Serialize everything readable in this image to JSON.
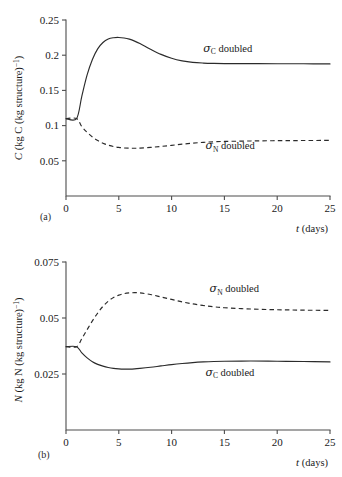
{
  "figure": {
    "cropped_top_caption": "",
    "panel_a_tag": "(a)",
    "panel_b_tag": "(b)"
  },
  "labels": {
    "t_italic": "t",
    "days": "(days)",
    "C_italic": "C",
    "N_italic": "N",
    "y_a_unit_1": "(kg C (kg structure)",
    "y_a_unit_sup": "−1",
    "y_a_unit_2": ")",
    "y_b_unit_1": "(kg N (kg structure)",
    "y_b_unit_sup": "−1",
    "y_b_unit_2": ")",
    "sigma": "σ",
    "sub_C": "C",
    "sub_N": "N",
    "doubled": "doubled"
  },
  "chart_data": [
    {
      "type": "line",
      "panel": "(a)",
      "title": "",
      "xlabel": "t (days)",
      "ylabel": "C (kg C (kg structure)−1)",
      "xlim": [
        0,
        25
      ],
      "ylim": [
        0,
        0.25
      ],
      "xticks": [
        0,
        5,
        10,
        15,
        20,
        25
      ],
      "xtick_labels": [
        "0",
        "5",
        "10",
        "15",
        "20",
        "25"
      ],
      "yticks": [
        0.05,
        0.1,
        0.15,
        0.2,
        0.25
      ],
      "ytick_labels": [
        "0.05",
        "0.1",
        "0.15",
        "0.2",
        "0.25"
      ],
      "grid": false,
      "legend": "inline-annotations",
      "x": [
        0,
        1,
        1.5,
        2,
        2.5,
        3,
        3.5,
        4,
        4.5,
        5,
        5.5,
        6,
        6.5,
        7,
        8,
        9,
        10,
        11,
        12,
        13,
        14,
        15,
        17.5,
        20,
        22.5,
        25
      ],
      "series": [
        {
          "name": "σC doubled",
          "style": "solid",
          "annotation": "σ_C doubled",
          "annotation_x": 13.0,
          "annotation_y": 0.205,
          "values": [
            0.11,
            0.11,
            0.142,
            0.172,
            0.194,
            0.209,
            0.218,
            0.223,
            0.2248,
            0.2252,
            0.2245,
            0.2228,
            0.22,
            0.2165,
            0.2085,
            0.2012,
            0.1957,
            0.192,
            0.1898,
            0.1888,
            0.1883,
            0.1881,
            0.188,
            0.1879,
            0.1878,
            0.1876
          ]
        },
        {
          "name": "σN doubled",
          "style": "dashed",
          "annotation": "σ_N doubled",
          "annotation_x": 13.2,
          "annotation_y": 0.0665,
          "values": [
            0.11,
            0.11,
            0.0985,
            0.0905,
            0.0838,
            0.0787,
            0.075,
            0.0722,
            0.0702,
            0.069,
            0.0682,
            0.0679,
            0.0678,
            0.068,
            0.069,
            0.0704,
            0.072,
            0.0736,
            0.075,
            0.0762,
            0.077,
            0.0775,
            0.0782,
            0.0786,
            0.0788,
            0.079
          ]
        }
      ]
    },
    {
      "type": "line",
      "panel": "(b)",
      "title": "",
      "xlabel": "t (days)",
      "ylabel": "N (kg N (kg structure)−1)",
      "xlim": [
        0,
        25
      ],
      "ylim": [
        0,
        0.075
      ],
      "xticks": [
        0,
        5,
        10,
        15,
        20,
        25
      ],
      "xtick_labels": [
        "0",
        "5",
        "10",
        "15",
        "20",
        "25"
      ],
      "yticks": [
        0.025,
        0.05,
        0.075
      ],
      "ytick_labels": [
        "0.025",
        "0.05",
        "0.075"
      ],
      "grid": false,
      "legend": "inline-annotations",
      "x": [
        0,
        1,
        1.5,
        2,
        2.5,
        3,
        3.5,
        4,
        4.5,
        5,
        5.5,
        6,
        6.5,
        7,
        8,
        9,
        10,
        11,
        12,
        13,
        14,
        15,
        17.5,
        20,
        22.5,
        25
      ],
      "series": [
        {
          "name": "σN doubled",
          "style": "dashed",
          "annotation": "σ_N doubled",
          "annotation_x": 13.6,
          "annotation_y": 0.0615,
          "values": [
            0.0372,
            0.0372,
            0.0408,
            0.0448,
            0.0487,
            0.0522,
            0.0552,
            0.0575,
            0.0592,
            0.0602,
            0.0609,
            0.0612,
            0.0613,
            0.0612,
            0.0605,
            0.0594,
            0.0583,
            0.0572,
            0.0563,
            0.0556,
            0.055,
            0.0546,
            0.054,
            0.0537,
            0.0535,
            0.0534
          ]
        },
        {
          "name": "σC doubled",
          "style": "solid",
          "annotation": "σ_C doubled",
          "annotation_x": 13.2,
          "annotation_y": 0.0243,
          "values": [
            0.0372,
            0.0372,
            0.0344,
            0.0322,
            0.0305,
            0.0293,
            0.0285,
            0.0279,
            0.0275,
            0.0273,
            0.0272,
            0.0272,
            0.0273,
            0.0275,
            0.028,
            0.0286,
            0.0292,
            0.0297,
            0.0301,
            0.0304,
            0.0306,
            0.0307,
            0.0308,
            0.0307,
            0.0306,
            0.0304
          ]
        }
      ]
    }
  ]
}
